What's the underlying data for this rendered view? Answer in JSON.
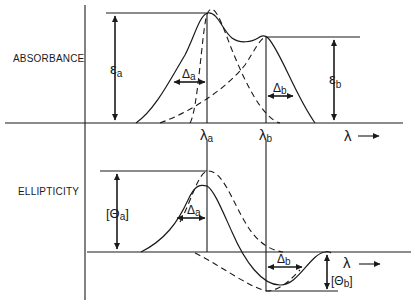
{
  "figure": {
    "upper_panel": {
      "ylabel": "ABSORBANCE",
      "peak_a": {
        "height_symbol": "ε",
        "height_sub": "a",
        "width_symbol": "Δ",
        "width_sub": "a",
        "wavelength_symbol": "λ",
        "wavelength_sub": "a"
      },
      "peak_b": {
        "height_symbol": "ε",
        "height_sub": "b",
        "width_symbol": "Δ",
        "width_sub": "b",
        "wavelength_symbol": "λ",
        "wavelength_sub": "b"
      },
      "xaxis_label": "λ"
    },
    "lower_panel": {
      "ylabel": "ELLIPTICITY",
      "band_a": {
        "height_label": "[Θ",
        "height_sub": "a",
        "height_close": "]",
        "width_symbol": "Δ",
        "width_sub": "a"
      },
      "band_b": {
        "height_label": "[Θ",
        "height_sub": "b",
        "height_close": "]",
        "width_symbol": "Δ",
        "width_sub": "b"
      },
      "xaxis_label": "λ"
    }
  }
}
